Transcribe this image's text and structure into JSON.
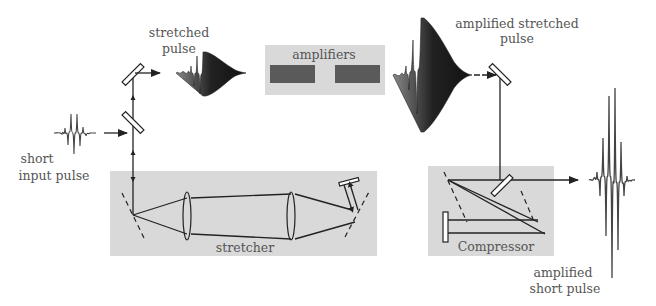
{
  "diagram": {
    "labels": {
      "input_pulse_line1": "short",
      "input_pulse_line2": "input pulse",
      "stretched_pulse_line1": "stretched",
      "stretched_pulse_line2": "pulse",
      "amplifiers": "amplifiers",
      "amplified_stretched_line1": "amplified stretched",
      "amplified_stretched_line2": "pulse",
      "stretcher": "stretcher",
      "compressor": "Compressor",
      "output_pulse_line1": "amplified",
      "output_pulse_line2": "short pulse"
    },
    "components": [
      {
        "id": "input-pulse",
        "type": "pulse"
      },
      {
        "id": "mirror-lower",
        "type": "mirror"
      },
      {
        "id": "mirror-upper",
        "type": "mirror"
      },
      {
        "id": "stretcher",
        "type": "box",
        "contains": [
          "grating",
          "lens",
          "lens",
          "grating",
          "mirror"
        ]
      },
      {
        "id": "stretched-pulse",
        "type": "pulse"
      },
      {
        "id": "amplifiers",
        "type": "box",
        "contains": [
          "gain-medium",
          "gain-medium"
        ]
      },
      {
        "id": "amplified-stretched-pulse",
        "type": "pulse"
      },
      {
        "id": "mirror-right",
        "type": "mirror"
      },
      {
        "id": "compressor",
        "type": "box",
        "contains": [
          "grating",
          "grating",
          "mirror",
          "mirror"
        ]
      },
      {
        "id": "output-pulse",
        "type": "pulse"
      }
    ],
    "colors": {
      "box_fill": "#d9d9d9",
      "amplifier_block": "#5a5a5a",
      "line": "#222222",
      "text": "#555555"
    }
  }
}
